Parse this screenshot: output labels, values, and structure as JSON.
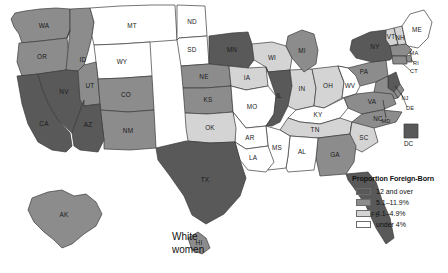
{
  "caption": {
    "line1": "White",
    "line2": "women"
  },
  "legend": {
    "title": "Proportion Foreign-Born",
    "entries": [
      {
        "label": "12 and over",
        "color": "#595959"
      },
      {
        "label": "5.1–11.9%",
        "color": "#8c8c8c"
      },
      {
        "label": "4.1–4.9%",
        "color": "#d4d4d4"
      },
      {
        "label": "under 4%",
        "color": "#ffffff"
      }
    ]
  },
  "colors": {
    "class_high": "#595959",
    "class_mid": "#8c8c8c",
    "class_low": "#d4d4d4",
    "class_lowest": "#ffffff",
    "border": "#3b3b3b"
  },
  "dc_marker": {
    "label": "DC",
    "color": "#595959"
  },
  "chart_data": {
    "type": "map",
    "title": "White women",
    "legend_title": "Proportion Foreign-Born",
    "value_unit": "percent",
    "classes": [
      {
        "label": "12 and over",
        "color": "#595959"
      },
      {
        "label": "5.1–11.9%",
        "color": "#8c8c8c"
      },
      {
        "label": "4.1–4.9%",
        "color": "#d4d4d4"
      },
      {
        "label": "under 4%",
        "color": "#ffffff"
      }
    ],
    "regions": [
      {
        "code": "WA",
        "label": "WA",
        "class": "5.1–11.9%"
      },
      {
        "code": "OR",
        "label": "OR",
        "class": "5.1–11.9%"
      },
      {
        "code": "ID",
        "label": "ID",
        "class": "5.1–11.9%"
      },
      {
        "code": "MT",
        "label": "MT",
        "class": "under 4%"
      },
      {
        "code": "ND",
        "label": "ND",
        "class": "under 4%"
      },
      {
        "code": "SD",
        "label": "SD",
        "class": "under 4%"
      },
      {
        "code": "MN",
        "label": "MN",
        "class": "12 and over"
      },
      {
        "code": "WI",
        "label": "WI",
        "class": "4.1–4.9%"
      },
      {
        "code": "WY",
        "label": "WY",
        "class": "under 4%"
      },
      {
        "code": "NE",
        "label": "NE",
        "class": "5.1–11.9%"
      },
      {
        "code": "IA",
        "label": "IA",
        "class": "4.1–4.9%"
      },
      {
        "code": "CA",
        "label": "CA",
        "class": "12 and over"
      },
      {
        "code": "NV",
        "label": "NV",
        "class": "12 and over"
      },
      {
        "code": "UT",
        "label": "UT",
        "class": "5.1–11.9%"
      },
      {
        "code": "CO",
        "label": "CO",
        "class": "5.1–11.9%"
      },
      {
        "code": "KS",
        "label": "KS",
        "class": "5.1–11.9%"
      },
      {
        "code": "MO",
        "label": "MO",
        "class": "under 4%"
      },
      {
        "code": "IL",
        "label": "IL",
        "class": "12 and over"
      },
      {
        "code": "IN",
        "label": "IN",
        "class": "4.1–4.9%"
      },
      {
        "code": "OH",
        "label": "OH",
        "class": "4.1–4.9%"
      },
      {
        "code": "MI",
        "label": "MI",
        "class": "5.1–11.9%"
      },
      {
        "code": "PA",
        "label": "PA",
        "class": "5.1–11.9%"
      },
      {
        "code": "NY",
        "label": "NY",
        "class": "12 and over"
      },
      {
        "code": "VT",
        "label": "VT",
        "class": "4.1–4.9%"
      },
      {
        "code": "NH",
        "label": "NH",
        "class": "4.1–4.9%"
      },
      {
        "code": "ME",
        "label": "ME",
        "class": "under 4%"
      },
      {
        "code": "MA",
        "label": "MA",
        "class": "5.1–11.9%"
      },
      {
        "code": "RI",
        "label": "RI",
        "class": "5.1–11.9%"
      },
      {
        "code": "CT",
        "label": "CT",
        "class": "5.1–11.9%"
      },
      {
        "code": "NJ",
        "label": "NJ",
        "class": "12 and over"
      },
      {
        "code": "DE",
        "label": "DE",
        "class": "5.1–11.9%"
      },
      {
        "code": "MD",
        "label": "MD",
        "class": "5.1–11.9%"
      },
      {
        "code": "DC",
        "label": "DC",
        "class": "12 and over"
      },
      {
        "code": "WV",
        "label": "WV",
        "class": "under 4%"
      },
      {
        "code": "VA",
        "label": "VA",
        "class": "5.1–11.9%"
      },
      {
        "code": "KY",
        "label": "KY",
        "class": "under 4%"
      },
      {
        "code": "TN",
        "label": "TN",
        "class": "4.1–4.9%"
      },
      {
        "code": "NC",
        "label": "NC",
        "class": "5.1–11.9%"
      },
      {
        "code": "SC",
        "label": "SC",
        "class": "4.1–4.9%"
      },
      {
        "code": "GA",
        "label": "GA",
        "class": "5.1–11.9%"
      },
      {
        "code": "FL",
        "label": "FL",
        "class": "12 and over"
      },
      {
        "code": "AL",
        "label": "AL",
        "class": "under 4%"
      },
      {
        "code": "MS",
        "label": "MS",
        "class": "under 4%"
      },
      {
        "code": "AR",
        "label": "AR",
        "class": "under 4%"
      },
      {
        "code": "LA",
        "label": "LA",
        "class": "under 4%"
      },
      {
        "code": "OK",
        "label": "OK",
        "class": "4.1–4.9%"
      },
      {
        "code": "TX",
        "label": "TX",
        "class": "12 and over"
      },
      {
        "code": "NM",
        "label": "NM",
        "class": "5.1–11.9%"
      },
      {
        "code": "AZ",
        "label": "AZ",
        "class": "12 and over"
      },
      {
        "code": "AK",
        "label": "AK",
        "class": "5.1–11.9%"
      },
      {
        "code": "HI",
        "label": "HI",
        "class": "5.1–11.9%"
      }
    ]
  }
}
